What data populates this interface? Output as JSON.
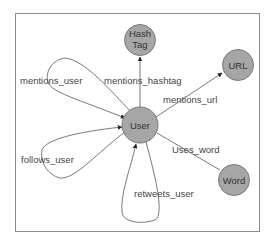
{
  "diagram": {
    "type": "graph",
    "nodes": [
      {
        "id": "hashtag",
        "label_lines": [
          "Hash",
          "Tag"
        ]
      },
      {
        "id": "url",
        "label_lines": [
          "URL"
        ]
      },
      {
        "id": "user",
        "label_lines": [
          "User"
        ]
      },
      {
        "id": "word",
        "label_lines": [
          "Word"
        ]
      }
    ],
    "edges": [
      {
        "id": "mentions_user",
        "from": "user",
        "to": "user",
        "label": "mentions_user",
        "directed": true
      },
      {
        "id": "mentions_hashtag",
        "from": "user",
        "to": "hashtag",
        "label": "mentions_hashtag",
        "directed": true
      },
      {
        "id": "mentions_url",
        "from": "user",
        "to": "url",
        "label": "mentions_url",
        "directed": true
      },
      {
        "id": "follows_user",
        "from": "user",
        "to": "user",
        "label": "follows_user",
        "directed": true
      },
      {
        "id": "uses_word",
        "from": "user",
        "to": "word",
        "label": "Uses_word",
        "directed": false
      },
      {
        "id": "retweets_user",
        "from": "user",
        "to": "user",
        "label": "retweets_user",
        "directed": true
      }
    ]
  }
}
